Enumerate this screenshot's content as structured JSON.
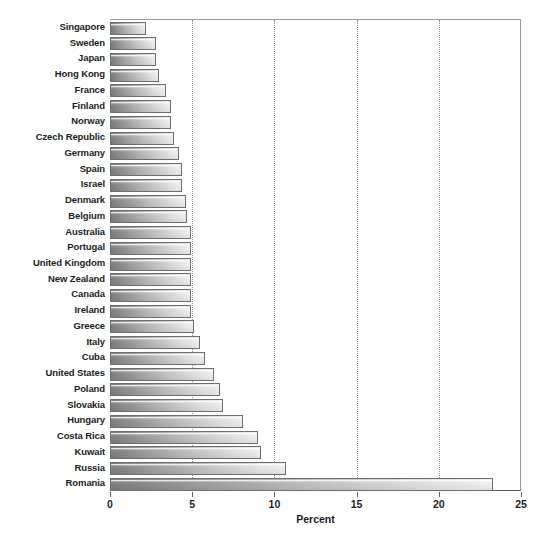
{
  "chart_data": {
    "type": "bar",
    "orientation": "horizontal",
    "title": "",
    "xlabel": "Percent",
    "ylabel": "",
    "xlim": [
      0,
      25
    ],
    "xticks": [
      0,
      5,
      10,
      15,
      20,
      25
    ],
    "xtick_labels": [
      "0",
      "5",
      "10",
      "15",
      "20",
      "25"
    ],
    "grid": "vertical-dotted",
    "legend": "none",
    "categories": [
      "Singapore",
      "Sweden",
      "Japan",
      "Hong Kong",
      "France",
      "Finland",
      "Norway",
      "Czech Republic",
      "Germany",
      "Spain",
      "Israel",
      "Denmark",
      "Belgium",
      "Australia",
      "Portugal",
      "United Kingdom",
      "New Zealand",
      "Canada",
      "Ireland",
      "Greece",
      "Italy",
      "Cuba",
      "United States",
      "Poland",
      "Slovakia",
      "Hungary",
      "Costa Rica",
      "Kuwait",
      "Russia",
      "Romania"
    ],
    "values": [
      2.2,
      2.8,
      2.8,
      3.0,
      3.4,
      3.7,
      3.7,
      3.9,
      4.2,
      4.4,
      4.4,
      4.6,
      4.7,
      4.9,
      4.9,
      4.9,
      4.9,
      4.9,
      4.9,
      5.1,
      5.5,
      5.8,
      6.3,
      6.7,
      6.9,
      8.1,
      9.0,
      9.2,
      10.7,
      23.3
    ],
    "colors": {
      "bar_gradient_start": "#7e7e7e",
      "bar_gradient_end": "#efefef",
      "bar_border": "#6e6e6e",
      "grid": "#8d8d8d",
      "axis": "#5a5a5a",
      "text": "#1c1c1c",
      "background": "#ffffff"
    }
  }
}
